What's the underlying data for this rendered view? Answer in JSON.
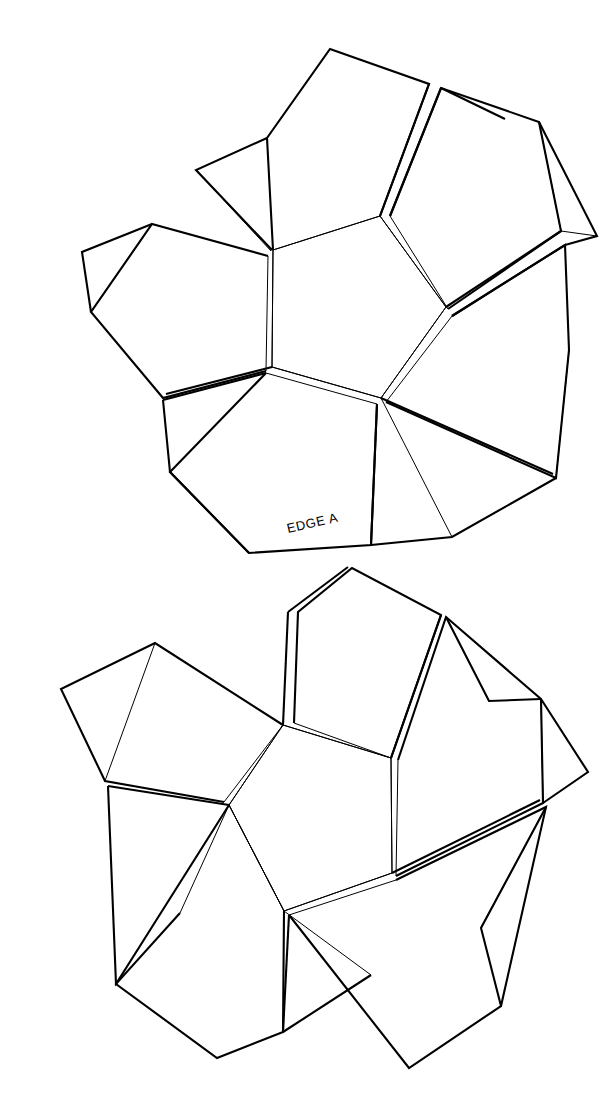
{
  "document": {
    "type": "papercraft-net-template",
    "title": "Dodecahedron Net Template",
    "background_color": "#ffffff",
    "line_color": "#000000",
    "page_width": 603,
    "page_height": 1118
  },
  "labels": [
    {
      "id": "edge-a",
      "text": "EDGE A",
      "x": 288,
      "y": 533,
      "rotation": -13,
      "font_size": 13
    }
  ],
  "nets": [
    {
      "id": "upper-net",
      "name": "Upper Half Net",
      "center_pentagon": [
        [
          273,
          250
        ],
        [
          380,
          216
        ],
        [
          446,
          307
        ],
        [
          381,
          398
        ],
        [
          272,
          367
        ]
      ],
      "outer_pentagons": [
        {
          "id": "upper-top",
          "points": [
            [
              273,
              250
            ],
            [
              267,
              138
            ],
            [
              330,
              49
            ],
            [
              429,
              84
            ],
            [
              380,
              216
            ]
          ]
        },
        {
          "id": "upper-right",
          "points": [
            [
              380,
              216
            ],
            [
              429,
              84
            ],
            [
              536,
              120
            ],
            [
              559,
              230
            ],
            [
              446,
              307
            ]
          ]
        },
        {
          "id": "upper-lower-right",
          "points": [
            [
              446,
              307
            ],
            [
              559,
              230
            ],
            [
              566,
              340
            ],
            [
              553,
              474
            ],
            [
              381,
              398
            ]
          ]
        },
        {
          "id": "upper-bottom",
          "points": [
            [
              381,
              398
            ],
            [
              553,
              474
            ],
            [
              452,
              536
            ],
            [
              381,
              541
            ],
            [
              272,
              367
            ]
          ]
        },
        {
          "id": "upper-left",
          "points": [
            [
              272,
              367
            ],
            [
              166,
              394
            ],
            [
              94,
              309
            ],
            [
              156,
              218
            ],
            [
              273,
              250
            ]
          ]
        }
      ],
      "petal_pentagons": [
        {
          "id": "p-top",
          "points": [
            [
              273,
              250
            ],
            [
              267,
              138
            ],
            [
              330,
              49
            ],
            [
              429,
              84
            ],
            [
              380,
              216
            ]
          ]
        },
        {
          "id": "p-upper-right",
          "points": [
            [
              388,
              219
            ],
            [
              438,
              90
            ],
            [
              540,
              124
            ],
            [
              562,
              232
            ],
            [
              449,
              310
            ]
          ]
        },
        {
          "id": "p-right-lower",
          "points": [
            [
              451,
              315
            ],
            [
              563,
              243
            ],
            [
              570,
              348
            ],
            [
              556,
              478
            ],
            [
              386,
              402
            ]
          ]
        },
        {
          "id": "p-bottom",
          "points": [
            [
              377,
              404
            ],
            [
              370,
              545
            ],
            [
              248,
              553
            ],
            [
              170,
              471
            ],
            [
              267,
              372
            ]
          ]
        },
        {
          "id": "p-left",
          "points": [
            [
              268,
              256
            ],
            [
              151,
              224
            ],
            [
              90,
              312
            ],
            [
              162,
              398
            ],
            [
              267,
              371
            ]
          ]
        }
      ],
      "tabs": [
        {
          "id": "tab-upper-left-1",
          "points": [
            [
              268,
              133
            ],
            [
              196,
              170
            ],
            [
              269,
              250
            ]
          ]
        },
        {
          "id": "tab-upper-right",
          "points": [
            [
              434,
              87
            ],
            [
              446,
              168
            ],
            [
              505,
              119
            ]
          ]
        },
        {
          "id": "tab-right",
          "points": [
            [
              561,
              236
            ],
            [
              566,
              340
            ],
            [
              518,
              290
            ]
          ]
        },
        {
          "id": "tab-bottom-right",
          "points": [
            [
              553,
              478
            ],
            [
              452,
              537
            ],
            [
              466,
              470
            ]
          ]
        },
        {
          "id": "tab-bottom-left",
          "points": [
            [
              170,
              471
            ],
            [
              163,
              402
            ],
            [
              250,
              442
            ]
          ]
        }
      ]
    },
    {
      "id": "lower-net",
      "name": "Lower Half Net",
      "center_pentagon": [
        [
          283,
          725
        ],
        [
          391,
          758
        ],
        [
          392,
          873
        ],
        [
          284,
          911
        ],
        [
          229,
          805
        ]
      ],
      "outer_pentagons": [
        {
          "id": "lower-top",
          "points": [
            [
              283,
              725
            ],
            [
              288,
              612
            ],
            [
              348,
              567
            ],
            [
              440,
              613
            ],
            [
              391,
              758
            ]
          ]
        },
        {
          "id": "lower-right",
          "points": [
            [
              391,
              758
            ],
            [
              440,
              613
            ],
            [
              538,
              696
            ],
            [
              540,
              800
            ],
            [
              392,
              873
            ]
          ]
        },
        {
          "id": "lower-bottom-right",
          "points": [
            [
              392,
              873
            ],
            [
              540,
              800
            ],
            [
              498,
              1002
            ],
            [
              408,
              1066
            ],
            [
              284,
              911
            ]
          ]
        },
        {
          "id": "lower-bottom-left",
          "points": [
            [
              284,
              911
            ],
            [
              283,
              1030
            ],
            [
              216,
              1056
            ],
            [
              116,
              982
            ],
            [
              229,
              805
            ]
          ]
        },
        {
          "id": "lower-left",
          "points": [
            [
              229,
              805
            ],
            [
              108,
              784
            ],
            [
              63,
              690
            ],
            [
              155,
              644
            ],
            [
              283,
              725
            ]
          ]
        }
      ],
      "tabs": [
        {
          "id": "tab-l-top",
          "points": [
            [
              288,
              612
            ],
            [
              294,
              723
            ],
            [
              350,
              570
            ]
          ]
        },
        {
          "id": "tab-l-upper-right",
          "points": [
            [
              441,
              617
            ],
            [
              489,
              702
            ],
            [
              539,
              699
            ]
          ]
        },
        {
          "id": "tab-l-right",
          "points": [
            [
              540,
              805
            ],
            [
              498,
              1005
            ],
            [
              481,
              927
            ]
          ]
        },
        {
          "id": "tab-l-bottom",
          "points": [
            [
              289,
              915
            ],
            [
              283,
              1032
            ],
            [
              371,
              974
            ]
          ]
        },
        {
          "id": "tab-l-left",
          "points": [
            [
              108,
              789
            ],
            [
              116,
              986
            ],
            [
              180,
              912
            ]
          ]
        }
      ]
    }
  ]
}
